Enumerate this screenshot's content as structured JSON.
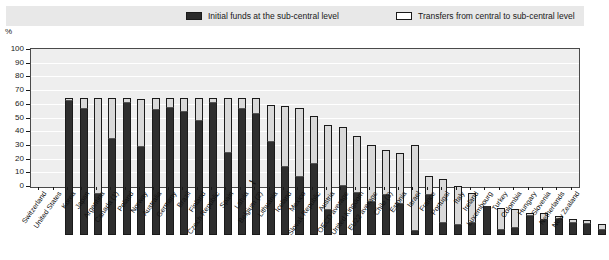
{
  "legend": {
    "initial_label": "Initial funds at the sub-central level",
    "transfers_label": "Transfers from central to sub-central level",
    "initial_color": "#2e2e2e",
    "transfers_color": "#d9d9d9"
  },
  "axis": {
    "y_unit": "%",
    "y_ticks": [
      "0",
      "10",
      "20",
      "30",
      "40",
      "50",
      "60",
      "70",
      "80",
      "90",
      "100"
    ],
    "break_marker": "⌇"
  },
  "chart_data": {
    "type": "bar",
    "title": "",
    "subtitle": "",
    "xlabel": "",
    "ylabel": "%",
    "ylim": [
      0,
      100
    ],
    "grid": true,
    "stacked": true,
    "legend_position": "top",
    "categories": [
      "Switzerland",
      "United States",
      "Korea",
      "Japan",
      "Argentina",
      "Canada (1)",
      "Poland",
      "Norway",
      "Australia",
      "Germany",
      "Brazil",
      "Finland",
      "Czech Republic",
      "Spain",
      "Latvia",
      "Belgium (2)",
      "Lithuania",
      "Iceland",
      "Mexico",
      "Slovak Republic",
      "Austria",
      "OECD average",
      "United Kingdom",
      "EU22 average",
      "Chile (3)",
      "Estonia",
      "Israel",
      "France",
      "Portugal",
      "Italy",
      "Ireland",
      "Luxembourg",
      "Turkey",
      "Colombia",
      "Hungary",
      "Slovenia",
      "Netherlands",
      "New Zealand"
    ],
    "series": [
      {
        "name": "Initial funds at the sub-central level",
        "color": "#2e2e2e",
        "values": [
          98,
          92,
          30,
          70,
          96,
          64,
          91,
          93,
          90,
          83,
          96,
          60,
          92,
          88,
          68,
          50,
          42,
          52,
          18,
          36,
          31,
          24,
          29,
          23,
          3,
          29,
          9,
          7,
          9,
          21,
          4,
          5,
          14,
          11,
          12,
          9,
          8,
          4
        ]
      },
      {
        "name": "Transfers from central to sub-central level",
        "color": "#d9d9d9",
        "values": [
          2,
          8,
          70,
          30,
          4,
          35,
          9,
          7,
          10,
          17,
          4,
          40,
          8,
          12,
          27,
          44,
          51,
          35,
          62,
          43,
          41,
          42,
          33,
          37,
          63,
          14,
          32,
          29,
          22,
          0,
          16,
          14,
          2,
          5,
          2,
          3,
          3,
          4
        ]
      }
    ],
    "totals": [
      100,
      100,
      100,
      100,
      100,
      99,
      100,
      100,
      100,
      100,
      100,
      100,
      100,
      100,
      95,
      94,
      93,
      87,
      80,
      79,
      72,
      66,
      62,
      60,
      66,
      43,
      41,
      36,
      31,
      21,
      20,
      19,
      16,
      16,
      14,
      12,
      11,
      8
    ]
  }
}
